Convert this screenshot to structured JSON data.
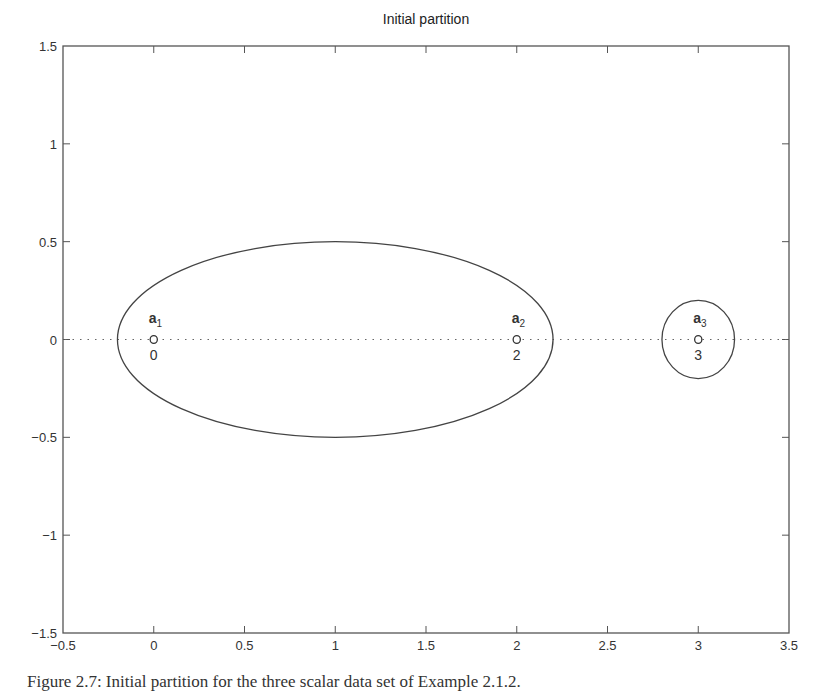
{
  "chart_data": {
    "type": "scatter",
    "title": "Initial partition",
    "xlabel": "",
    "ylabel": "",
    "xlim": [
      -0.5,
      3.5
    ],
    "ylim": [
      -1.5,
      1.5
    ],
    "grid": false,
    "x_ticks": [
      -0.5,
      0,
      0.5,
      1,
      1.5,
      2,
      2.5,
      3,
      3.5
    ],
    "x_tick_labels": [
      "−0.5",
      "0",
      "0.5",
      "1",
      "1.5",
      "2",
      "2.5",
      "3",
      "3.5"
    ],
    "y_ticks": [
      1.5,
      1,
      0.5,
      0,
      -0.5,
      -1,
      -1.5
    ],
    "y_tick_labels": [
      "1.5",
      "1",
      "0.5",
      "0",
      "−0.5",
      "−1",
      "−1.5"
    ],
    "points": [
      {
        "name": "a",
        "subscript": "1",
        "x": 0,
        "y": 0,
        "value_label": "0",
        "marker": "o"
      },
      {
        "name": "a",
        "subscript": "2",
        "x": 2,
        "y": 0,
        "value_label": "2",
        "marker": "o"
      },
      {
        "name": "a",
        "subscript": "3",
        "x": 3,
        "y": 0,
        "value_label": "3",
        "marker": "o"
      }
    ],
    "reference_line": {
      "y": 0,
      "style": "dotted"
    },
    "clusters": [
      {
        "members": [
          "a1",
          "a2"
        ],
        "shape": "ellipse",
        "cx": 1.0,
        "cy": 0,
        "rx": 1.2,
        "ry": 0.5
      },
      {
        "members": [
          "a3"
        ],
        "shape": "ellipse",
        "cx": 3.0,
        "cy": 0,
        "rx": 0.2,
        "ry": 0.2
      }
    ]
  },
  "caption": "Figure 2.7: Initial partition for the three scalar data set of Example 2.1.2."
}
